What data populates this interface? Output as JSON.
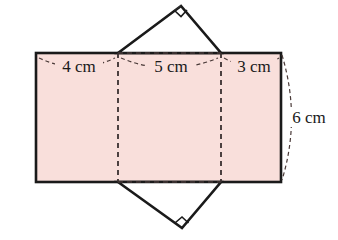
{
  "figure": {
    "background_color": "#ffffff",
    "face_fill_color": "#f9dfdb",
    "outline_color": "#1a1a1a",
    "fold_line_color": "#3a3030",
    "labels": {
      "left_face": "4 cm",
      "middle_face": "5 cm",
      "right_face": "3 cm",
      "height": "6 cm"
    },
    "markers": {
      "top_right_angle": "right-angle",
      "bottom_right_angle": "right-angle"
    },
    "geometry": {
      "rect_left_x": 36,
      "rect_right_x": 281,
      "rect_top_y": 53,
      "rect_bottom_y": 182,
      "fold_x1": 118,
      "fold_x2": 221,
      "top_apex": [
        181,
        6
      ],
      "bottom_apex": [
        182,
        228
      ]
    }
  }
}
